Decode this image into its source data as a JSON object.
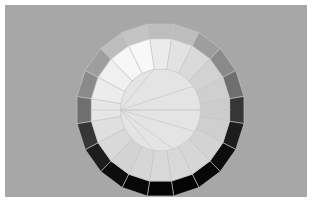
{
  "scene": {
    "width": 312,
    "height": 203,
    "frame_bg": "#ffffff",
    "panel": {
      "x": 5,
      "y": 5,
      "w": 302,
      "h": 192,
      "color": "#a7a7a7"
    },
    "object": "low-poly cylinder viewed from above",
    "center": {
      "x": 160.5,
      "y": 110
    },
    "segments": 20,
    "outer_radius_x": 84.5,
    "outer_radius_y": 87,
    "mid_radius_x": 70,
    "mid_radius_y": 72,
    "inner_radius_x": 40,
    "inner_radius_y": 41,
    "outer_band_colors": [
      "#bdbdbd",
      "#bdbdbd",
      "#9e9e9e",
      "#8a8a8a",
      "#6f6f6f",
      "#363636",
      "#1d1d1d",
      "#0d0d0d",
      "#070707",
      "#050505",
      "#050505",
      "#070707",
      "#0d0d0d",
      "#1d1d1d",
      "#363636",
      "#6f6f6f",
      "#8a8a8a",
      "#9e9e9e",
      "#bdbdbd",
      "#c4c4c4"
    ],
    "mid_ring_colors": [
      "#ebebeb",
      "#e2e2e2",
      "#dadada",
      "#d2d2d2",
      "#cfcfcf",
      "#cdcdcd",
      "#cfcfcf",
      "#d3d3d3",
      "#d6d6d6",
      "#d8d8d8",
      "#d8d8d8",
      "#d6d6d6",
      "#d3d3d3",
      "#d9d9d9",
      "#dfdfdf",
      "#e6e6e6",
      "#ececec",
      "#f0f0f0",
      "#f6f6f6",
      "#f8f8f8"
    ],
    "inner_disc_color": "#e4e4e4",
    "edge_color": "#c8c8c8",
    "fan_origin_index": 10,
    "fan_target_indices": [
      2,
      4,
      6,
      0,
      14,
      16,
      18
    ]
  }
}
